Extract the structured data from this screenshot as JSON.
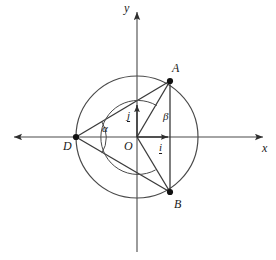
{
  "figure": {
    "kind": "geometry-diagram",
    "width": 276,
    "height": 260,
    "background_color": "#ffffff",
    "stroke_color": "#3a3a3a",
    "text_color": "#1a1a1a"
  },
  "axes": {
    "x_label": "x",
    "y_label": "y",
    "origin_label": "O",
    "x_axis": {
      "x1": 12,
      "y1": 137,
      "x2": 265,
      "y2": 137
    },
    "y_axis": {
      "x1": 137,
      "y1": 250,
      "x2": 137,
      "y2": 10
    },
    "x_label_pos": {
      "x": 262,
      "y": 144
    },
    "y_label_pos": {
      "x": 124,
      "y": 2
    },
    "origin_label_pos": {
      "x": 124,
      "y": 140
    }
  },
  "circle": {
    "center": {
      "x": 137,
      "y": 137
    },
    "radius": 61
  },
  "points": [
    {
      "name": "A",
      "x": 170,
      "y": 81,
      "label": "A",
      "label_x": 172,
      "label_y": 63,
      "dot": true
    },
    {
      "name": "B",
      "x": 170,
      "y": 192,
      "label": "B",
      "label_x": 174,
      "label_y": 199,
      "dot": true
    },
    {
      "name": "D",
      "x": 76,
      "y": 137,
      "label": "D",
      "label_x": 63,
      "label_y": 141,
      "dot": true
    },
    {
      "name": "O",
      "x": 137,
      "y": 137,
      "label": "O",
      "label_x": 124,
      "label_y": 140,
      "dot": false
    }
  ],
  "segments": [
    {
      "name": "DA",
      "from": "D",
      "to": "A",
      "arrow": false
    },
    {
      "name": "DB",
      "from": "D",
      "to": "B",
      "arrow": false
    },
    {
      "name": "OA",
      "from": "O",
      "to": "A",
      "arrow": false
    },
    {
      "name": "OB",
      "from": "O",
      "to": "B",
      "arrow": false
    },
    {
      "name": "AB",
      "from": "A",
      "to": "B",
      "arrow": false
    }
  ],
  "vectors": [
    {
      "name": "i",
      "label": "i",
      "from": {
        "x": 137,
        "y": 137
      },
      "to": {
        "x": 170,
        "y": 137
      },
      "label_x": 158,
      "label_y": 143
    },
    {
      "name": "j",
      "label": "j",
      "from": {
        "x": 137,
        "y": 137
      },
      "to": {
        "x": 137,
        "y": 103
      },
      "label_x": 126,
      "label_y": 110
    }
  ],
  "angles": [
    {
      "name": "alpha",
      "label": "α",
      "vertex": "D",
      "vertex_x": 76,
      "vertex_y": 137,
      "radius": 30,
      "label_x": 102,
      "label_y": 124,
      "between": [
        "DA",
        "DB"
      ]
    },
    {
      "name": "beta",
      "label": "β",
      "vertex": "O",
      "vertex_x": 137,
      "vertex_y": 137,
      "radius": 37,
      "label_x": 163,
      "label_y": 112,
      "between": [
        "OA",
        "OB"
      ]
    }
  ]
}
